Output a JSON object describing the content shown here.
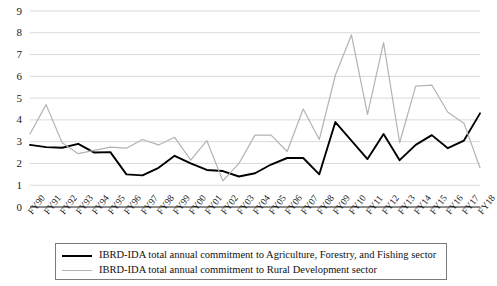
{
  "chart_data": {
    "type": "line",
    "title": "",
    "subtitle": "",
    "xlabel": "",
    "ylabel": "",
    "ylim": [
      0,
      9
    ],
    "yticks": [
      0,
      1,
      2,
      3,
      4,
      5,
      6,
      7,
      8,
      9
    ],
    "grid": true,
    "legend_position": "bottom",
    "categories": [
      "FY90",
      "FY91",
      "FY92",
      "FY93",
      "FY94",
      "FY95",
      "FY96",
      "FY97",
      "FY98",
      "FY99",
      "FY00",
      "FY01",
      "FY02",
      "FY03",
      "FY04",
      "FY05",
      "FY06",
      "FY07",
      "FY08",
      "FY09",
      "FY10",
      "FY11",
      "FY12",
      "FY13",
      "FY14",
      "FY15",
      "FY16",
      "FY17",
      "FY18"
    ],
    "series": [
      {
        "name": "IBRD-IDA total annual commitment to Agriculture, Forestry, and Fishing sector",
        "color": "#000000",
        "values": [
          2.85,
          2.75,
          2.72,
          2.9,
          2.5,
          2.52,
          1.5,
          1.45,
          1.8,
          2.35,
          2.0,
          1.7,
          1.65,
          1.4,
          1.55,
          1.95,
          2.25,
          2.25,
          1.5,
          3.9,
          3.05,
          2.2,
          3.35,
          2.15,
          2.85,
          3.3,
          2.7,
          3.05,
          4.3
        ]
      },
      {
        "name": "IBRD-IDA total annual commitment to Rural Development sector",
        "color": "#b3b3b3",
        "values": [
          3.35,
          4.7,
          2.95,
          2.45,
          2.6,
          2.75,
          2.7,
          3.1,
          2.85,
          3.2,
          2.15,
          3.05,
          1.2,
          2.0,
          3.3,
          3.3,
          2.55,
          4.5,
          3.1,
          6.05,
          7.9,
          4.25,
          7.55,
          2.95,
          5.55,
          5.6,
          4.35,
          3.85,
          1.8
        ]
      }
    ]
  }
}
